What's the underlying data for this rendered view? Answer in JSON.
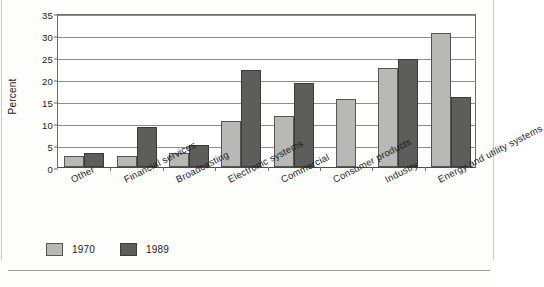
{
  "chart_data": {
    "type": "bar",
    "title": "",
    "xlabel": "",
    "ylabel": "Percent",
    "ylim": [
      0,
      35
    ],
    "yticks": [
      0,
      5,
      10,
      15,
      20,
      25,
      30,
      35
    ],
    "grid": true,
    "legend_position": "bottom-left",
    "categories": [
      "Other",
      "Financial services",
      "Broadcasting",
      "Electronic systems",
      "Commercial",
      "Consumer products",
      "Industry",
      "Energy and utility systems"
    ],
    "series": [
      {
        "name": "1970",
        "color": "#b8b8b6",
        "values": [
          2.4,
          2.5,
          3.1,
          10.5,
          11.5,
          15.5,
          22.5,
          30.5
        ]
      },
      {
        "name": "1989",
        "color": "#5d5d5b",
        "values": [
          3.1,
          9.0,
          4.9,
          22.0,
          19.0,
          null,
          24.5,
          16.0
        ]
      }
    ]
  },
  "axes": {
    "y_title": "Percent",
    "y_tick_labels": [
      "0",
      "5",
      "10",
      "15",
      "20",
      "25",
      "30",
      "35"
    ]
  },
  "legend": {
    "entries": [
      {
        "label": "1970",
        "swatch": "light-gray-swatch"
      },
      {
        "label": "1989",
        "swatch": "dark-gray-swatch"
      }
    ]
  }
}
